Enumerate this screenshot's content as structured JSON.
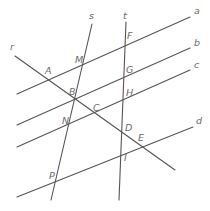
{
  "diagram": {
    "line_color": "#555555",
    "label_color": "#6a6a6a",
    "lines": [
      {
        "name": "a",
        "label": "a",
        "x1": 17,
        "y1": 94,
        "x2": 190,
        "y2": 17,
        "lx": 194,
        "ly": 14
      },
      {
        "name": "b",
        "label": "b",
        "x1": 17,
        "y1": 125,
        "x2": 190,
        "y2": 48,
        "lx": 194,
        "ly": 46
      },
      {
        "name": "c",
        "label": "c",
        "x1": 17,
        "y1": 147,
        "x2": 190,
        "y2": 70,
        "lx": 194,
        "ly": 68
      },
      {
        "name": "d",
        "label": "d",
        "x1": 17,
        "y1": 197,
        "x2": 193,
        "y2": 127,
        "lx": 196,
        "ly": 124
      },
      {
        "name": "r",
        "label": "r",
        "x1": 15,
        "y1": 56,
        "x2": 175,
        "y2": 170,
        "lx": 10,
        "ly": 50
      },
      {
        "name": "s",
        "label": "s",
        "x1": 92,
        "y1": 24,
        "x2": 51,
        "y2": 200,
        "lx": 89,
        "ly": 19
      },
      {
        "name": "t",
        "label": "t",
        "x1": 126,
        "y1": 22,
        "x2": 119,
        "y2": 200,
        "lx": 123,
        "ly": 19
      }
    ],
    "points": [
      {
        "name": "A",
        "label": "A",
        "lx": 45,
        "ly": 74
      },
      {
        "name": "M",
        "label": "M",
        "lx": 75,
        "ly": 63
      },
      {
        "name": "F",
        "label": "F",
        "lx": 127,
        "ly": 39
      },
      {
        "name": "B",
        "label": "B",
        "lx": 69,
        "ly": 95
      },
      {
        "name": "G",
        "label": "G",
        "lx": 126,
        "ly": 73
      },
      {
        "name": "C",
        "label": "C",
        "lx": 93,
        "ly": 111
      },
      {
        "name": "H",
        "label": "H",
        "lx": 126,
        "ly": 96
      },
      {
        "name": "N",
        "label": "N",
        "lx": 62,
        "ly": 124
      },
      {
        "name": "D",
        "label": "D",
        "lx": 125,
        "ly": 131
      },
      {
        "name": "E",
        "label": "E",
        "lx": 138,
        "ly": 141
      },
      {
        "name": "I",
        "label": "I",
        "lx": 124,
        "ly": 161
      },
      {
        "name": "P",
        "label": "P",
        "lx": 49,
        "ly": 179
      }
    ]
  }
}
